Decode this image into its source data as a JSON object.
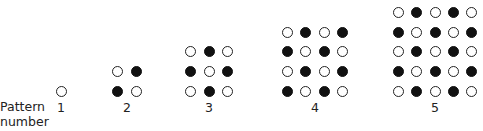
{
  "axis_label": {
    "line1": "Pattern",
    "line2": "number"
  },
  "patterns": [
    {
      "number": "1",
      "center_x": 61,
      "rows": [
        "o"
      ]
    },
    {
      "number": "2",
      "center_x": 127,
      "rows": [
        "o●",
        "●o"
      ]
    },
    {
      "number": "3",
      "center_x": 209,
      "rows": [
        "o●o",
        "●o●",
        "o●o"
      ]
    },
    {
      "number": "4",
      "center_x": 315,
      "rows": [
        "o●o●",
        "●o●o",
        "o●o●",
        "●o●o"
      ]
    },
    {
      "number": "5",
      "center_x": 435,
      "rows": [
        "o●o●o",
        "●o●o●",
        "o●o●o",
        "●o●o●",
        "o●o●o"
      ]
    }
  ],
  "colors": {
    "filled": "#111111",
    "outline": "#222222",
    "background": "#ffffff"
  },
  "layout": {
    "spacing_x": 18.3,
    "spacing_y": 19.6,
    "bottom_row_y": 91,
    "dot_diameter": 11
  }
}
